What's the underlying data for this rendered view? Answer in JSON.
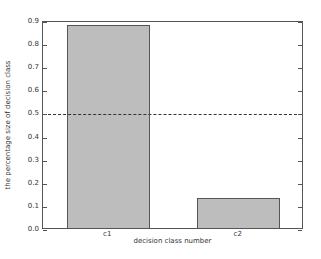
{
  "chart_data": {
    "type": "bar",
    "title": "",
    "xlabel": "decision class number",
    "ylabel": "the percentage size of decision class",
    "categories": [
      "c1",
      "c2"
    ],
    "values": [
      0.88,
      0.13
    ],
    "ylim": [
      0.0,
      0.9
    ],
    "yticks": [
      "0.0",
      "0.1",
      "0.2",
      "0.3",
      "0.4",
      "0.5",
      "0.6",
      "0.7",
      "0.8",
      "0.9"
    ],
    "reference_line": {
      "y": 0.5,
      "style": "dashed",
      "color": "#333333"
    },
    "bar_color": "#bdbdbd",
    "grid": false,
    "legend": null
  }
}
